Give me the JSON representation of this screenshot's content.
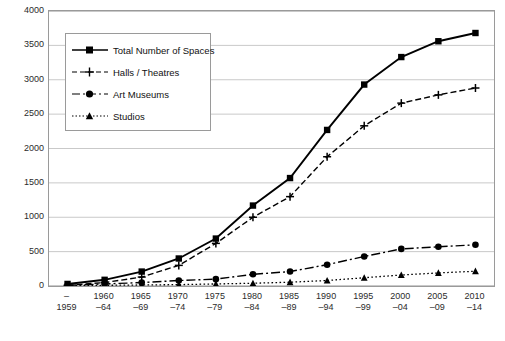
{
  "chart_data": {
    "type": "line",
    "title": "",
    "xlabel": "",
    "ylabel": "",
    "ylim": [
      0,
      4000
    ],
    "ytick_step": 500,
    "grid": true,
    "legend_position": "top-left-inside",
    "yticks": [
      "0",
      "500",
      "1000",
      "1500",
      "2000",
      "2500",
      "3000",
      "3500",
      "4000"
    ],
    "categories": [
      {
        "line1": "–",
        "line2": "1959"
      },
      {
        "line1": "1960",
        "line2": "–64"
      },
      {
        "line1": "1965",
        "line2": "–69"
      },
      {
        "line1": "1970",
        "line2": "–74"
      },
      {
        "line1": "1975",
        "line2": "–79"
      },
      {
        "line1": "1980",
        "line2": "–84"
      },
      {
        "line1": "1985",
        "line2": "–89"
      },
      {
        "line1": "1990",
        "line2": "–94"
      },
      {
        "line1": "1995",
        "line2": "–99"
      },
      {
        "line1": "2000",
        "line2": "–04"
      },
      {
        "line1": "2005",
        "line2": "–09"
      },
      {
        "line1": "2010",
        "line2": "–14"
      }
    ],
    "series": [
      {
        "name": "Total Number of Spaces",
        "marker": "square",
        "dash": "solid",
        "values": [
          30,
          90,
          210,
          400,
          690,
          1170,
          1570,
          2270,
          2930,
          3330,
          3560,
          3680
        ]
      },
      {
        "name": "Halls / Theatres",
        "marker": "plus",
        "dash": "dashed",
        "values": [
          10,
          50,
          130,
          300,
          620,
          1000,
          1300,
          1880,
          2330,
          2660,
          2780,
          2880
        ]
      },
      {
        "name": "Art Museums",
        "marker": "circle",
        "dash": "dashdot",
        "values": [
          10,
          30,
          50,
          80,
          100,
          170,
          210,
          310,
          430,
          540,
          570,
          600
        ]
      },
      {
        "name": "Studios",
        "marker": "triangle",
        "dash": "dotted",
        "values": [
          5,
          10,
          15,
          20,
          30,
          40,
          55,
          80,
          120,
          160,
          190,
          215
        ]
      }
    ]
  }
}
